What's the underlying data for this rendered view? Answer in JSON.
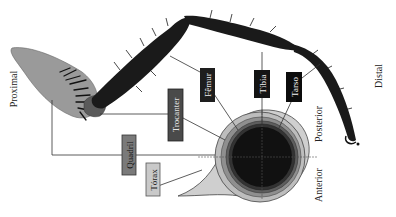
{
  "diagram": {
    "orientation_labels": {
      "proximal": "Proximal",
      "distal": "Distal",
      "posterior": "Posterior",
      "anterior": "Anterior"
    },
    "segments": [
      {
        "id": "torax",
        "label": "Tórax",
        "box_fill": "#c9c9c9",
        "text_color": "#222222"
      },
      {
        "id": "quadril",
        "label": "Quadril",
        "box_fill": "#7a7a7a",
        "text_color": "#111111"
      },
      {
        "id": "trocanter",
        "label": "Trocanter",
        "box_fill": "#4a4a4a",
        "text_color": "#e6e6e6"
      },
      {
        "id": "femur",
        "label": "Fêmur",
        "box_fill": "#1e1e1e",
        "text_color": "#f0f0f0"
      },
      {
        "id": "tibia",
        "label": "Tíbia",
        "box_fill": "#141414",
        "text_color": "#f0f0f0"
      },
      {
        "id": "tarso",
        "label": "Tarso",
        "box_fill": "#0c0c0c",
        "text_color": "#f0f0f0"
      }
    ],
    "colors": {
      "thorax": "#cfcfcf",
      "coxa": "#9a9a9a",
      "leg_dark": "#1a1a1a",
      "ring1": "#bdbdbd",
      "ring2": "#8f8f8f",
      "ring3": "#5e5e5e",
      "ring4": "#333333",
      "ring5": "#111111",
      "line": "#333333"
    }
  }
}
